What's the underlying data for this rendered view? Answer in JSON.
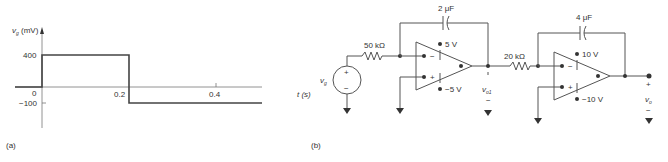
{
  "panel_a": {
    "label": "(a)",
    "y_axis_label": "v",
    "y_axis_sub": "g",
    "y_axis_unit": "(mV)",
    "x_axis_label": "t (s)",
    "ticks": {
      "y400": "400",
      "y0": "0",
      "ym100": "−100",
      "x02": "0.2",
      "x04": "0.4"
    },
    "waveform": {
      "segments": [
        {
          "t_start": 0,
          "t_end": 0.2,
          "v_mV": 400
        },
        {
          "t_start": 0.2,
          "t_end": 0.5,
          "v_mV": -100
        }
      ]
    }
  },
  "panel_b": {
    "label": "(b)",
    "source_label": "v",
    "source_sub": "g",
    "source_plus": "+",
    "source_minus": "−",
    "r1": "50 kΩ",
    "c1": "2 μF",
    "opamp1_vpos": "5 V",
    "opamp1_vneg": "−5 V",
    "r2": "20 kΩ",
    "c2": "4 μF",
    "opamp2_vpos": "10 V",
    "opamp2_vneg": "−10 V",
    "out1_label": "v",
    "out1_sub": "o1",
    "out2_label": "v",
    "out2_sub": "o",
    "plus": "+",
    "minus": "−"
  }
}
